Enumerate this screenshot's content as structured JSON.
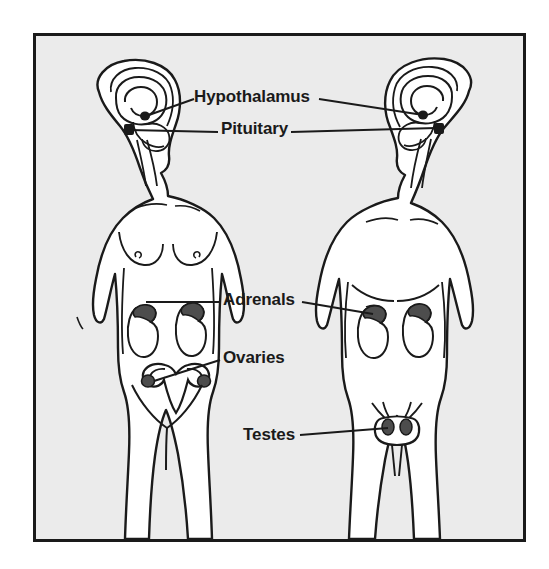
{
  "figure": {
    "background_color": "#ebebeb",
    "border_color": "#1a1a1a",
    "ink_color": "#1a1a1a",
    "gland_fill_color": "#4d4d4d",
    "body_fill_color": "#ffffff"
  },
  "labels": [
    {
      "id": "hypothalamus",
      "text": "Hypothalamus",
      "targets": [
        "female-brain",
        "male-brain"
      ]
    },
    {
      "id": "pituitary",
      "text": "Pituitary",
      "targets": [
        "female-brain",
        "male-brain"
      ]
    },
    {
      "id": "adrenals",
      "text": "Adrenals",
      "targets": [
        "female-abdomen",
        "male-abdomen"
      ]
    },
    {
      "id": "ovaries",
      "text": "Ovaries",
      "targets": [
        "female-pelvis"
      ]
    },
    {
      "id": "testes",
      "text": "Testes",
      "targets": [
        "male-pelvis"
      ]
    }
  ],
  "figures": [
    {
      "id": "female-figure",
      "sex": "female",
      "facing": "viewer, head turned to the left",
      "glands": [
        "hypothalamus",
        "pituitary",
        "adrenals",
        "ovaries"
      ]
    },
    {
      "id": "male-figure",
      "sex": "male",
      "facing": "viewer, head turned to the right",
      "glands": [
        "hypothalamus",
        "pituitary",
        "adrenals",
        "testes"
      ]
    }
  ]
}
